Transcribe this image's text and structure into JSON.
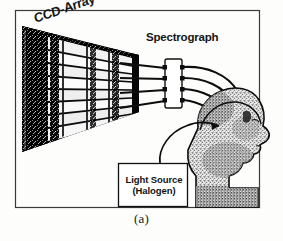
{
  "figure": {
    "caption": "(a)",
    "labels": {
      "ccd_array": "CCD-Array",
      "spectrograph": "Spectrograph",
      "light_source_line1": "Light Source",
      "light_source_line2": "(Halogen)"
    },
    "colors": {
      "ink": "#111111",
      "paper": "#fdfdfc",
      "ccd_panel": "#050505",
      "spectral_band": "#ffffff",
      "frame": "#2a2a2a",
      "head_fill": "#cfcfcf"
    },
    "components": [
      {
        "name": "ccd-array",
        "type": "detector-panel",
        "bands": 7
      },
      {
        "name": "spectrograph",
        "type": "instrument-box",
        "ports": 4
      },
      {
        "name": "optical-fibers",
        "type": "fiber-bundle",
        "count": 4
      },
      {
        "name": "head",
        "type": "human-head-profile",
        "orientation": "right"
      },
      {
        "name": "light-source",
        "type": "labeled-box"
      }
    ]
  }
}
